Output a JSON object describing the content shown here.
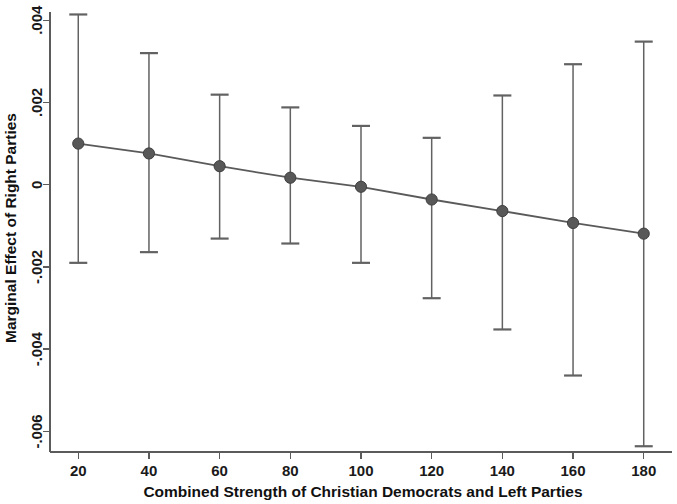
{
  "chart_data": {
    "type": "line",
    "title": "",
    "subtitle": "",
    "xlabel": "Combined Strength of Christian Democrats and Left Parties",
    "ylabel": "Marginal Effect of Right Parties",
    "xlim": [
      12,
      188
    ],
    "ylim": [
      -0.0065,
      0.0042
    ],
    "grid": false,
    "legend": null,
    "x_ticks": [
      20,
      40,
      60,
      80,
      100,
      120,
      140,
      160,
      180
    ],
    "x_tick_labels": [
      "20",
      "40",
      "60",
      "80",
      "100",
      "120",
      "140",
      "160",
      "180"
    ],
    "y_ticks": [
      0.004,
      0.002,
      0,
      -0.002,
      -0.004,
      -0.006
    ],
    "y_tick_labels": [
      ".004",
      ".002",
      "0",
      "-.002",
      "-.004",
      "-.006"
    ],
    "x": [
      20,
      40,
      60,
      80,
      100,
      120,
      140,
      160,
      180
    ],
    "series": [
      {
        "name": "Marginal effect",
        "values": [
          0.001,
          0.00076,
          0.00045,
          0.00017,
          -5e-05,
          -0.00036,
          -0.00064,
          -0.00093,
          -0.00119
        ],
        "ci_lower": [
          -0.0019,
          -0.00164,
          -0.00131,
          -0.00143,
          -0.0019,
          -0.00276,
          -0.00352,
          -0.00464,
          -0.00636
        ],
        "ci_upper": [
          0.00414,
          0.0032,
          0.00219,
          0.00188,
          0.00143,
          0.00114,
          0.00217,
          0.00293,
          0.00348
        ]
      }
    ],
    "marker": "circle",
    "error_bars": "95% confidence interval"
  },
  "figure": {
    "x_axis_title": "Combined Strength of Christian Democrats and Left Parties",
    "y_axis_title": "Marginal Effect of Right Parties"
  }
}
